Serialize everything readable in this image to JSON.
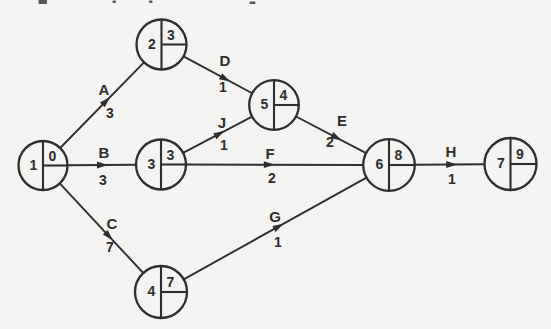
{
  "palette": {
    "background": "#f4f4f2",
    "ink": "#2f2e2c"
  },
  "diagram": {
    "type": "activity-on-arrow-network",
    "nodes": [
      {
        "event": "1",
        "x": 43,
        "y": 165.5,
        "r": 24.5,
        "earliest": "0",
        "latest": ""
      },
      {
        "event": "2",
        "x": 161.5,
        "y": 44.5,
        "r": 25,
        "earliest": "3",
        "latest": ""
      },
      {
        "event": "3",
        "x": 161,
        "y": 164.5,
        "r": 25,
        "earliest": "3",
        "latest": ""
      },
      {
        "event": "5",
        "x": 274,
        "y": 105,
        "r": 24.8,
        "earliest": "4",
        "latest": ""
      },
      {
        "event": "4",
        "x": 161,
        "y": 292,
        "r": 26,
        "earliest": "7",
        "latest": ""
      },
      {
        "event": "6",
        "x": 389,
        "y": 165,
        "r": 25.8,
        "earliest": "8",
        "latest": ""
      },
      {
        "event": "7",
        "x": 510.5,
        "y": 164,
        "r": 26,
        "earliest": "9",
        "latest": ""
      }
    ],
    "edges": [
      {
        "activity": "A",
        "duration": "3",
        "from": "1",
        "to": "2",
        "arrow_t": 0.55,
        "letter_at": [
          104,
          89
        ],
        "value_at": [
          110,
          113
        ]
      },
      {
        "activity": "B",
        "duration": "3",
        "from": "1",
        "to": "3",
        "arrow_t": 0.51,
        "letter_at": [
          104,
          152
        ],
        "value_at": [
          103,
          180
        ]
      },
      {
        "activity": "C",
        "duration": "7",
        "from": "1",
        "to": "4",
        "arrow_t": 0.59,
        "letter_at": [
          112,
          223
        ],
        "value_at": [
          110,
          247
        ]
      },
      {
        "activity": "D",
        "duration": "1",
        "from": "2",
        "to": "5",
        "arrow_t": 0.61,
        "letter_at": [
          225,
          60
        ],
        "value_at": [
          223,
          87
        ]
      },
      {
        "activity": "J",
        "duration": "1",
        "from": "3",
        "to": "5",
        "arrow_t": 0.53,
        "letter_at": [
          222,
          122
        ],
        "value_at": [
          224,
          145
        ]
      },
      {
        "activity": "F",
        "duration": "2",
        "from": "3",
        "to": "6",
        "arrow_t": 0.47,
        "letter_at": [
          270,
          153
        ],
        "value_at": [
          272,
          178
        ]
      },
      {
        "activity": "E",
        "duration": "2",
        "from": "5",
        "to": "6",
        "arrow_t": 0.58,
        "letter_at": [
          342,
          120
        ],
        "value_at": [
          330,
          142
        ]
      },
      {
        "activity": "G",
        "duration": "1",
        "from": "4",
        "to": "6",
        "arrow_t": 0.52,
        "letter_at": [
          275,
          216
        ],
        "value_at": [
          278,
          242
        ]
      },
      {
        "activity": "H",
        "duration": "1",
        "from": "6",
        "to": "7",
        "arrow_t": 0.53,
        "letter_at": [
          451,
          151
        ],
        "value_at": [
          452,
          179
        ]
      }
    ],
    "cropped_caption_marks": [
      {
        "x": 38.5,
        "y": 0,
        "w": 8.5,
        "h": 4
      },
      {
        "x": 112.5,
        "y": 0.5,
        "w": 3.5,
        "h": 2.5
      },
      {
        "x": 149,
        "y": 0.5,
        "w": 3.5,
        "h": 2.5
      },
      {
        "x": 249.5,
        "y": 1.5,
        "w": 6,
        "h": 2.5
      }
    ]
  }
}
